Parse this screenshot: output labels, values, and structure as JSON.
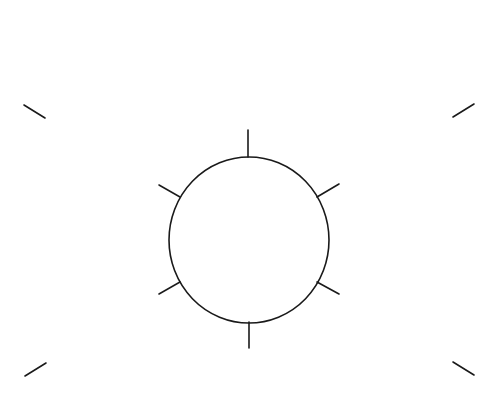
{
  "diagram": {
    "canvas": {
      "width": 501,
      "height": 408,
      "background": "#ffffff"
    },
    "stroke_color": "#1a1a1a",
    "stroke_width": 1.6,
    "circle": {
      "cx": 249,
      "cy": 240,
      "rx": 80,
      "ry": 83
    },
    "radial_ticks": [
      {
        "name": "top",
        "x1": 248,
        "y1": 130,
        "x2": 248,
        "y2": 157
      },
      {
        "name": "upper-right",
        "x1": 339,
        "y1": 184,
        "x2": 317,
        "y2": 197
      },
      {
        "name": "lower-right",
        "x1": 339,
        "y1": 294,
        "x2": 317,
        "y2": 282
      },
      {
        "name": "bottom",
        "x1": 249,
        "y1": 322,
        "x2": 249,
        "y2": 348
      },
      {
        "name": "lower-left",
        "x1": 159,
        "y1": 294,
        "x2": 180,
        "y2": 282
      },
      {
        "name": "upper-left",
        "x1": 159,
        "y1": 185,
        "x2": 180,
        "y2": 197
      }
    ],
    "corner_marks": [
      {
        "name": "top-left",
        "x1": 24,
        "y1": 105,
        "x2": 45,
        "y2": 118
      },
      {
        "name": "top-right",
        "x1": 453,
        "y1": 117,
        "x2": 474,
        "y2": 104
      },
      {
        "name": "bottom-left",
        "x1": 25,
        "y1": 376,
        "x2": 46,
        "y2": 363
      },
      {
        "name": "bottom-right",
        "x1": 453,
        "y1": 362,
        "x2": 474,
        "y2": 375
      }
    ]
  }
}
